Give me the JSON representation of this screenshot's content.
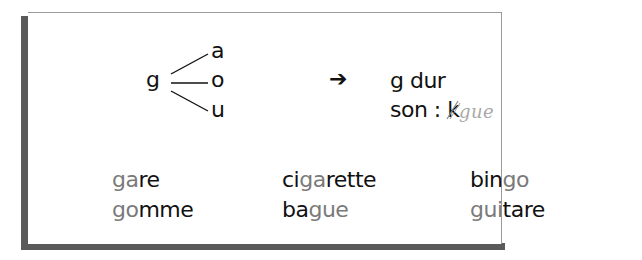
{
  "rule": {
    "letter": "g",
    "vowels": [
      "a",
      "o",
      "u"
    ],
    "arrow": "➔",
    "result_label": "g dur",
    "sound_label": "son :",
    "sound_struck": "k",
    "sound_handwritten": "gue"
  },
  "examples": {
    "columns": [
      [
        {
          "parts": [
            {
              "text": "ga",
              "hl": true
            },
            {
              "text": "re",
              "hl": false
            }
          ]
        },
        {
          "parts": [
            {
              "text": "go",
              "hl": true
            },
            {
              "text": "mme",
              "hl": false
            }
          ]
        }
      ],
      [
        {
          "parts": [
            {
              "text": "ci",
              "hl": false
            },
            {
              "text": "ga",
              "hl": true
            },
            {
              "text": "rette",
              "hl": false
            }
          ]
        },
        {
          "parts": [
            {
              "text": "ba",
              "hl": false
            },
            {
              "text": "gue",
              "hl": true
            }
          ]
        }
      ],
      [
        {
          "parts": [
            {
              "text": "bin",
              "hl": false
            },
            {
              "text": "go",
              "hl": true
            }
          ]
        },
        {
          "parts": [
            {
              "text": "gui",
              "hl": true
            },
            {
              "text": "tare",
              "hl": false
            }
          ]
        }
      ]
    ]
  },
  "colors": {
    "text": "#111111",
    "highlight": "#7a7a7a",
    "handwriting": "#a9a9a9",
    "shadow": "#5a5a5a"
  }
}
